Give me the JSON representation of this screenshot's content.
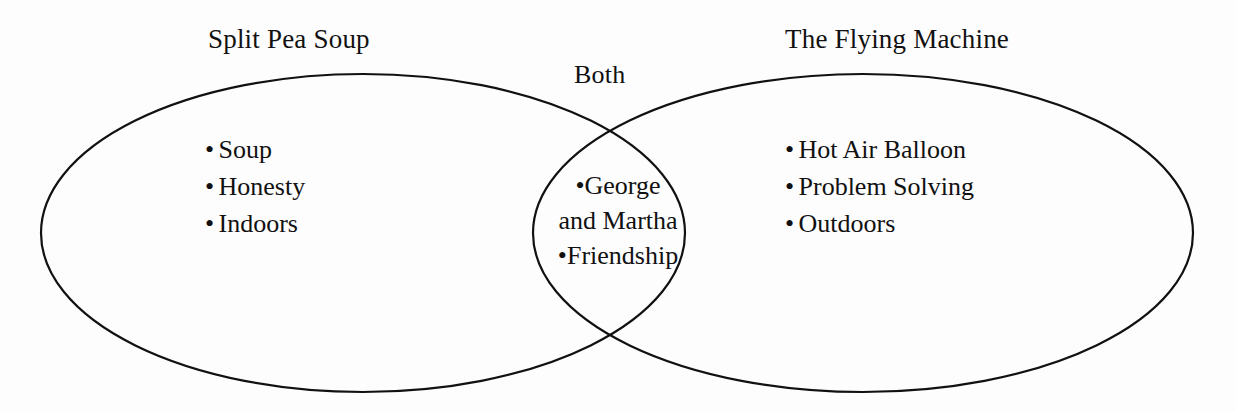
{
  "diagram": {
    "type": "venn",
    "kind": "two-circle-venn-diagram",
    "background_color": "#fdfdfd",
    "stroke_color": "#111111",
    "text_color": "#111111"
  },
  "titles": {
    "left": "Split Pea Soup",
    "right": "The Flying Machine",
    "center": "Both"
  },
  "bullet_glyph": "•",
  "sets": {
    "left": {
      "label": "Split Pea Soup",
      "items": [
        "Soup",
        "Honesty",
        "Indoors"
      ]
    },
    "right": {
      "label": "The Flying Machine",
      "items": [
        "Hot Air Balloon",
        "Problem Solving",
        "Outdoors"
      ]
    },
    "intersection": {
      "label": "Both",
      "items": [
        "George and Martha",
        "Friendship"
      ],
      "rendered_lines": [
        "George",
        "and Martha",
        "Friendship"
      ]
    }
  },
  "chart_data": {
    "type": "venn",
    "title": "",
    "sets": [
      {
        "name": "Split Pea Soup",
        "only": [
          "Soup",
          "Honesty",
          "Indoors"
        ],
        "count": 3
      },
      {
        "name": "The Flying Machine",
        "only": [
          "Hot Air Balloon",
          "Problem Solving",
          "Outdoors"
        ],
        "count": 3
      }
    ],
    "intersection": {
      "name": "Both",
      "items": [
        "George and Martha",
        "Friendship"
      ],
      "count": 2
    },
    "legend": "none",
    "grid": false
  },
  "geometry": {
    "left_ellipse": {
      "cx": 363,
      "cy": 233,
      "rx": 322,
      "ry": 159
    },
    "right_ellipse": {
      "cx": 863,
      "cy": 233,
      "rx": 330,
      "ry": 159
    },
    "stroke_width": 2.2
  }
}
